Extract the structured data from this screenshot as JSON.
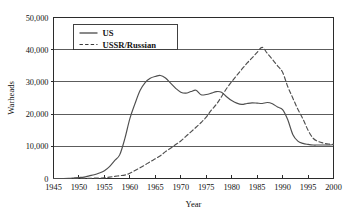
{
  "chart_data": {
    "type": "line",
    "title": "",
    "xlabel": "Year",
    "ylabel": "Warheads",
    "xlim": [
      1945,
      2000
    ],
    "ylim": [
      0,
      50000
    ],
    "grid": "horizontal",
    "legend_position": "top-left-inside",
    "xticks": [
      1945,
      1950,
      1955,
      1960,
      1965,
      1970,
      1975,
      1980,
      1985,
      1990,
      1995,
      2000
    ],
    "xtick_labels": [
      "1945",
      "1950",
      "1955",
      "1960",
      "1965",
      "1970",
      "1975",
      "1980",
      "1985",
      "1990",
      "1995",
      "2000"
    ],
    "yticks": [
      0,
      10000,
      20000,
      30000,
      40000,
      50000
    ],
    "ytick_labels": [
      "0",
      "10,000",
      "20,000",
      "30,000",
      "40,000",
      "50,000"
    ],
    "series": [
      {
        "name": "US",
        "style": "solid",
        "color": "#4f4f4f",
        "x": [
          1945,
          1946,
          1947,
          1948,
          1949,
          1950,
          1951,
          1952,
          1953,
          1954,
          1955,
          1956,
          1957,
          1958,
          1959,
          1960,
          1961,
          1962,
          1963,
          1964,
          1965,
          1966,
          1967,
          1968,
          1969,
          1970,
          1971,
          1972,
          1973,
          1974,
          1975,
          1976,
          1977,
          1978,
          1979,
          1980,
          1981,
          1982,
          1983,
          1984,
          1985,
          1986,
          1987,
          1988,
          1989,
          1990,
          1991,
          1992,
          1993,
          1994,
          1995,
          1996,
          1997,
          1998,
          1999,
          2000
        ],
        "values": [
          2,
          9,
          13,
          50,
          170,
          300,
          440,
          830,
          1170,
          1700,
          2420,
          3690,
          5540,
          7340,
          12300,
          18600,
          23200,
          27300,
          29800,
          31100,
          31700,
          32000,
          31200,
          29600,
          28000,
          26800,
          26500,
          27000,
          27400,
          26000,
          26100,
          26500,
          27000,
          26800,
          25400,
          24200,
          23400,
          23000,
          23300,
          23500,
          23400,
          23300,
          23600,
          23200,
          22200,
          21400,
          18300,
          13700,
          11600,
          10900,
          10600,
          10400,
          10400,
          10400,
          10400,
          10500
        ]
      },
      {
        "name": "USSR/Russian",
        "style": "dashed",
        "color": "#4f4f4f",
        "x": [
          1945,
          1946,
          1947,
          1948,
          1949,
          1950,
          1951,
          1952,
          1953,
          1954,
          1955,
          1956,
          1957,
          1958,
          1959,
          1960,
          1961,
          1962,
          1963,
          1964,
          1965,
          1966,
          1967,
          1968,
          1969,
          1970,
          1971,
          1972,
          1973,
          1974,
          1975,
          1976,
          1977,
          1978,
          1979,
          1980,
          1981,
          1982,
          1983,
          1984,
          1985,
          1986,
          1987,
          1988,
          1989,
          1990,
          1991,
          1992,
          1993,
          1994,
          1995,
          1996,
          1997,
          1998,
          1999,
          2000
        ],
        "values": [
          0,
          0,
          0,
          0,
          1,
          5,
          25,
          50,
          120,
          150,
          200,
          426,
          660,
          869,
          1060,
          1605,
          2471,
          3322,
          4238,
          5221,
          6129,
          7089,
          8339,
          9399,
          10538,
          11643,
          13092,
          14478,
          15915,
          17385,
          19055,
          21205,
          23044,
          25393,
          27935,
          30062,
          32049,
          33952,
          35804,
          37431,
          39197,
          40723,
          38859,
          37000,
          35000,
          33000,
          28595,
          25000,
          21500,
          18500,
          15000,
          12500,
          11500,
          11000,
          10700,
          10600
        ]
      }
    ]
  },
  "legend": {
    "entries": [
      {
        "label": "US",
        "style": "solid"
      },
      {
        "label": "USSR/Russian",
        "style": "dashed"
      }
    ]
  }
}
